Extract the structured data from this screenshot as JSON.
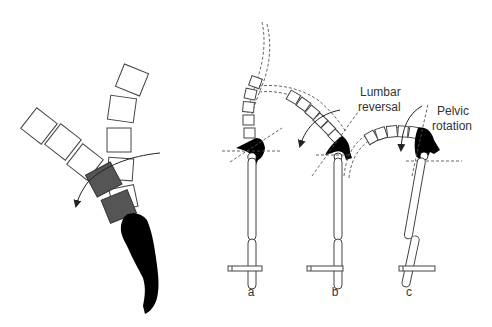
{
  "figure": {
    "annotations": {
      "lumbar_line1": "Lumbar",
      "lumbar_line2": "reversal",
      "pelvic_line1": "Pelvic",
      "pelvic_line2": "rotation"
    },
    "panel_labels": {
      "a": "a",
      "b": "b",
      "c": "c"
    },
    "colors": {
      "stroke": "#333333",
      "highlight_vertebra": "#555555",
      "pelvis": "#000000",
      "background": "#ffffff"
    }
  }
}
